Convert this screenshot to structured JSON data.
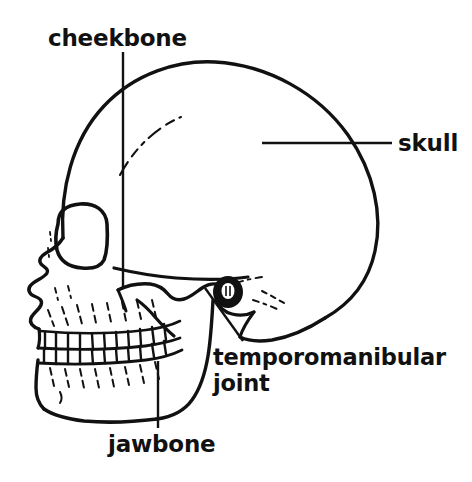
{
  "figure": {
    "kind": "anatomical-line-drawing",
    "background_color": "#ffffff",
    "ink_color": "#111111"
  },
  "labels": {
    "cheekbone": "cheekbone",
    "skull": "skull",
    "temporomandibular_joint_line1": "temporomanibular",
    "temporomandibular_joint_line2": "joint",
    "jawbone": "jawbone"
  },
  "leader_lines": [
    {
      "name": "cheekbone-leader",
      "orientation": "vertical",
      "from": [
        123,
        52
      ],
      "to": [
        123,
        287
      ]
    },
    {
      "name": "skull-leader",
      "orientation": "horizontal",
      "from": [
        262,
        143
      ],
      "to": [
        392,
        143
      ]
    },
    {
      "name": "tmj-leader",
      "orientation": "diagonal",
      "from": [
        243,
        341
      ],
      "to": [
        205,
        288
      ]
    },
    {
      "name": "jawbone-leader",
      "orientation": "vertical",
      "from": [
        158,
        428
      ],
      "to": [
        158,
        361
      ]
    }
  ],
  "parts": [
    "cranium",
    "frontal bone",
    "coronal suture",
    "orbit",
    "nasal aperture",
    "maxilla",
    "zygomatic arch",
    "external auditory meatus",
    "mandibular condyle",
    "mandible",
    "upper teeth",
    "lower teeth"
  ]
}
